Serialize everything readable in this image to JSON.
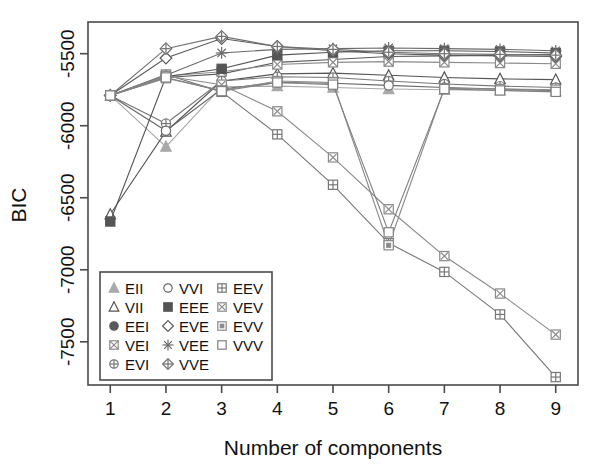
{
  "chart_data": {
    "type": "line",
    "title": "",
    "xlabel": "Number of components",
    "ylabel": "BIC",
    "x": [
      1,
      2,
      3,
      4,
      5,
      6,
      7,
      8,
      9
    ],
    "xticks": [
      "1",
      "2",
      "3",
      "4",
      "5",
      "6",
      "7",
      "8",
      "9"
    ],
    "yticks": [
      "-5500",
      "-6000",
      "-6500",
      "-7000",
      "-7500"
    ],
    "ytick_values": [
      -5500,
      -6000,
      -6500,
      -7000,
      -7500
    ],
    "xlim": [
      0.6,
      9.4
    ],
    "ylim": [
      -7800,
      -5280
    ],
    "grid": false,
    "legend_position": "bottom-left",
    "legend_columns": 3,
    "series": [
      {
        "name": "EII",
        "symbol": "filled-triangle",
        "color": "#a9a9a9",
        "values": [
          -5790,
          -6145,
          -5730,
          -5725,
          -5735,
          -5745,
          -5750,
          -5755,
          -5760
        ]
      },
      {
        "name": "VII",
        "symbol": "open-triangle",
        "color": "#555555",
        "values": [
          -6615,
          -6040,
          -5690,
          -5640,
          -5635,
          -5650,
          -5665,
          -5675,
          -5680
        ]
      },
      {
        "name": "EEI",
        "symbol": "filled-circle",
        "color": "#595959",
        "values": [
          -5790,
          -5665,
          -5640,
          -5560,
          -5540,
          -5520,
          -5515,
          -5510,
          -5505
        ]
      },
      {
        "name": "VEI",
        "symbol": "crossed-square",
        "color": "#8a8a8a",
        "values": [
          -5790,
          -5655,
          -5625,
          -5575,
          -5560,
          -5555,
          -5560,
          -5565,
          -5570
        ]
      },
      {
        "name": "EVI",
        "symbol": "circle-plus",
        "color": "#777777",
        "values": [
          -5790,
          -5985,
          -5690,
          -5660,
          -5665,
          -5690,
          -5710,
          -5725,
          -5735
        ]
      },
      {
        "name": "VVI",
        "symbol": "open-circle",
        "color": "#666666",
        "values": [
          -5790,
          -6035,
          -5745,
          -5700,
          -5705,
          -5720,
          -5735,
          -5745,
          -5755
        ]
      },
      {
        "name": "EEE",
        "symbol": "filled-square",
        "color": "#555555",
        "values": [
          -6665,
          -5660,
          -5605,
          -5510,
          -5490,
          -5480,
          -5480,
          -5485,
          -5495
        ]
      },
      {
        "name": "EVE",
        "symbol": "open-diamond",
        "color": "#5a5a5a",
        "values": [
          -5790,
          -5530,
          -5395,
          -5450,
          -5480,
          -5500,
          -5510,
          -5515,
          -5520
        ]
      },
      {
        "name": "VEE",
        "symbol": "asterisk",
        "color": "#6a6a6a",
        "values": [
          -5790,
          -5650,
          -5495,
          -5470,
          -5465,
          -5460,
          -5465,
          -5470,
          -5480
        ]
      },
      {
        "name": "VVE",
        "symbol": "diamond-plus",
        "color": "#707070",
        "values": [
          -5790,
          -5465,
          -5380,
          -5450,
          -5470,
          -5490,
          -5500,
          -5505,
          -5510
        ]
      },
      {
        "name": "EEV",
        "symbol": "square-plus",
        "color": "#777777",
        "values": [
          -5790,
          -5645,
          -5765,
          -6060,
          -6410,
          -6815,
          -7015,
          -7310,
          -7745
        ]
      },
      {
        "name": "VEV",
        "symbol": "square-x",
        "color": "#8a8a8a",
        "values": [
          -5790,
          -5655,
          -5715,
          -5900,
          -6220,
          -6580,
          -6905,
          -7165,
          -7450
        ]
      },
      {
        "name": "EVV",
        "symbol": "square-small",
        "color": "#8a8a8a",
        "values": [
          -5790,
          -5670,
          -5755,
          -5690,
          -5700,
          -6830,
          -5740,
          -5745,
          -5750
        ]
      },
      {
        "name": "VVV",
        "symbol": "open-square",
        "color": "#808080",
        "values": [
          -5790,
          -5665,
          -5760,
          -5700,
          -5715,
          -6740,
          -5745,
          -5755,
          -5765
        ]
      }
    ]
  },
  "legend": {
    "columns": [
      [
        "EII",
        "VII",
        "EEI",
        "VEI",
        "EVI"
      ],
      [
        "VVI",
        "EEE",
        "EVE",
        "VEE",
        "VVE"
      ],
      [
        "EEV",
        "VEV",
        "EVV",
        "VVV"
      ]
    ]
  },
  "colors": {
    "axis": "#4a4a4a",
    "text": "#111111",
    "background": "#ffffff",
    "light_gray": "#a9a9a9",
    "mid_gray": "#777777",
    "dark_gray": "#555555"
  }
}
